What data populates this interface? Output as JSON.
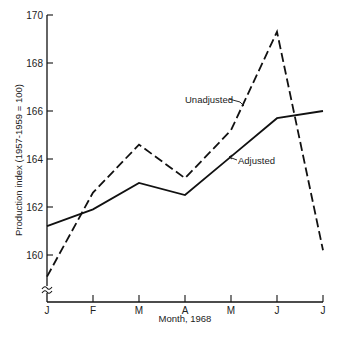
{
  "chart_data": {
    "type": "line",
    "title": "",
    "xlabel": "Month, 1968",
    "ylabel": "Production index (1957-1959 = 100)",
    "categories": [
      "J",
      "F",
      "M",
      "A",
      "M",
      "J",
      "J"
    ],
    "ylim": [
      158,
      170
    ],
    "yticks": [
      160,
      162,
      164,
      166,
      168,
      170
    ],
    "y_axis_break": true,
    "grid": false,
    "legend": "inline labels with arrows",
    "series": [
      {
        "name": "Unadjusted",
        "style": "dashed",
        "color": "#111111",
        "values": [
          159.1,
          162.6,
          164.6,
          163.2,
          165.2,
          169.3,
          160.2
        ]
      },
      {
        "name": "Adjusted",
        "style": "solid",
        "color": "#111111",
        "values": [
          161.2,
          161.9,
          163.0,
          162.5,
          164.1,
          165.7,
          166.0
        ]
      }
    ]
  }
}
